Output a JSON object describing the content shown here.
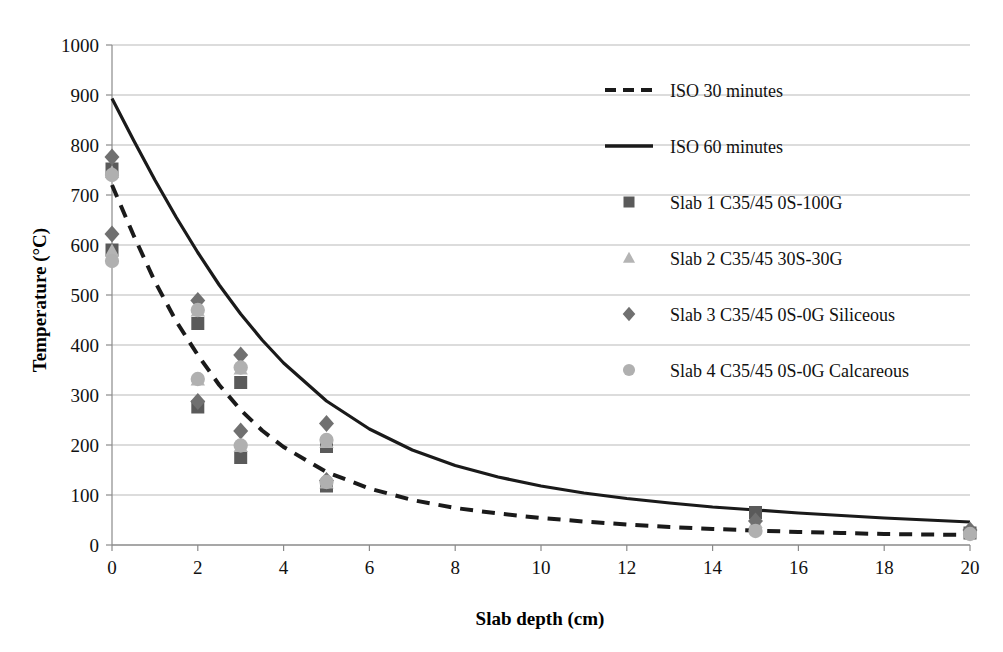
{
  "chart_data": {
    "type": "scatter",
    "title": "",
    "xlabel": "Slab depth (cm)",
    "ylabel": "Temperature (°C)",
    "xlim": [
      0,
      20
    ],
    "ylim": [
      0,
      1000
    ],
    "xticks": [
      0,
      2,
      4,
      6,
      8,
      10,
      12,
      14,
      16,
      18,
      20
    ],
    "yticks": [
      0,
      100,
      200,
      300,
      400,
      500,
      600,
      700,
      800,
      900,
      1000
    ],
    "grid": "horizontal",
    "legend_position": "upper right inside",
    "series": [
      {
        "name": "ISO 30 minutes",
        "type": "line",
        "style": "dashed",
        "color": "#1a1a1a",
        "x": [
          0,
          0.5,
          1,
          1.5,
          2,
          2.5,
          3,
          3.5,
          4,
          5,
          6,
          7,
          8,
          9,
          10,
          11,
          12,
          13,
          14,
          15,
          16,
          17,
          18,
          19,
          20
        ],
        "y": [
          720,
          620,
          527,
          447,
          380,
          320,
          270,
          229,
          196,
          146,
          113,
          90,
          74,
          63,
          54,
          47,
          41,
          36,
          32,
          29,
          26,
          24,
          22,
          21,
          20
        ]
      },
      {
        "name": "ISO 60 minutes",
        "type": "line",
        "style": "solid",
        "color": "#1a1a1a",
        "x": [
          0,
          0.5,
          1,
          1.5,
          2,
          2.5,
          3,
          3.5,
          4,
          5,
          6,
          7,
          8,
          9,
          10,
          11,
          12,
          13,
          14,
          15,
          16,
          17,
          18,
          19,
          20
        ],
        "y": [
          893,
          810,
          730,
          655,
          585,
          520,
          462,
          410,
          364,
          288,
          232,
          190,
          159,
          136,
          118,
          104,
          93,
          84,
          76,
          70,
          64,
          59,
          54,
          50,
          46
        ]
      },
      {
        "name": "Slab 1 C35/45 0S-100G",
        "type": "scatter",
        "marker": "square",
        "color": "#5a5a5a",
        "x": [
          0,
          0,
          2,
          2,
          3,
          3,
          5,
          5,
          15,
          20
        ],
        "y": [
          752,
          590,
          443,
          276,
          325,
          175,
          197,
          118,
          65,
          24
        ]
      },
      {
        "name": "Slab 2 C35/45 30S-30G",
        "type": "scatter",
        "marker": "triangle",
        "color": "#b4b4b4",
        "x": [
          0,
          0,
          2,
          2,
          3,
          3,
          5,
          5,
          15,
          20
        ],
        "y": [
          745,
          588,
          468,
          330,
          352,
          197,
          205,
          124,
          45,
          26
        ]
      },
      {
        "name": "Slab 3 C35/45 0S-0G Siliceous",
        "type": "scatter",
        "marker": "diamond",
        "color": "#707070",
        "x": [
          0,
          0,
          2,
          2,
          3,
          3,
          5,
          5,
          15,
          20
        ],
        "y": [
          776,
          622,
          489,
          287,
          380,
          228,
          243,
          129,
          48,
          30
        ]
      },
      {
        "name": "Slab 4 C35/45 0S-0G Calcareous",
        "type": "scatter",
        "marker": "circle",
        "color": "#b0b0b0",
        "x": [
          0,
          0,
          2,
          2,
          3,
          3,
          5,
          5,
          15,
          20
        ],
        "y": [
          740,
          568,
          470,
          332,
          355,
          199,
          210,
          126,
          28,
          22
        ]
      }
    ]
  },
  "axes": {
    "x_title": "Slab depth (cm)",
    "y_title": "Temperature (°C)",
    "x_tick_labels": [
      "0",
      "2",
      "4",
      "6",
      "8",
      "10",
      "12",
      "14",
      "16",
      "18",
      "20"
    ],
    "y_tick_labels": [
      "0",
      "100",
      "200",
      "300",
      "400",
      "500",
      "600",
      "700",
      "800",
      "900",
      "1000"
    ]
  },
  "legend": {
    "items": [
      {
        "label": "ISO 30 minutes",
        "marker": "dashed-line",
        "color": "#1a1a1a"
      },
      {
        "label": "ISO 60 minutes",
        "marker": "solid-line",
        "color": "#1a1a1a"
      },
      {
        "label": "Slab 1 C35/45 0S-100G",
        "marker": "square",
        "color": "#5a5a5a"
      },
      {
        "label": "Slab 2 C35/45 30S-30G",
        "marker": "triangle",
        "color": "#b4b4b4"
      },
      {
        "label": "Slab 3 C35/45 0S-0G Siliceous",
        "marker": "diamond",
        "color": "#707070"
      },
      {
        "label": "Slab 4 C35/45 0S-0G Calcareous",
        "marker": "circle",
        "color": "#b0b0b0"
      }
    ]
  },
  "style": {
    "grid_color": "#b9b9b9",
    "axis_color": "#8a8a8a",
    "background": "#ffffff",
    "text_color": "#111111"
  }
}
